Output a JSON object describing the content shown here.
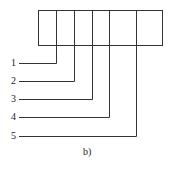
{
  "diagram": {
    "caption": "b)",
    "labels": [
      "1",
      "2",
      "3",
      "4",
      "5"
    ],
    "stroke_color": "#333333",
    "background": "#ffffff"
  }
}
